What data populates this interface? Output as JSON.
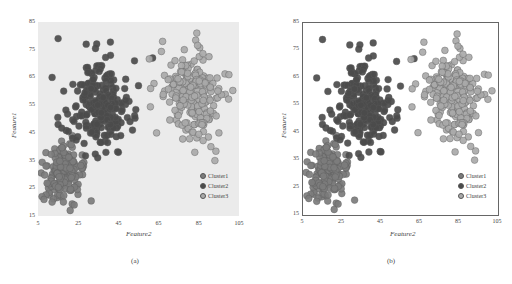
{
  "figure": {
    "panels": [
      {
        "id": "a",
        "caption": "(a)",
        "style": "ggplot-gray-background"
      },
      {
        "id": "b",
        "caption": "(b)",
        "style": "framed-white-background"
      }
    ]
  },
  "chart_data": [
    {
      "type": "scatter",
      "title": "",
      "caption": "(a)",
      "xlabel": "Feature2",
      "ylabel": "Feature1",
      "xlim": [
        5,
        105
      ],
      "ylim": [
        15,
        85
      ],
      "xticks": [
        "5",
        "25",
        "45",
        "65",
        "85",
        "105"
      ],
      "yticks": [
        "15",
        "25",
        "35",
        "45",
        "55",
        "65",
        "75",
        "85"
      ],
      "grid": false,
      "background": "#ebebeb",
      "legend_position": "lower right",
      "series": [
        {
          "name": "Cluster1",
          "color": "#7c7c7c",
          "center": [
            17,
            30
          ],
          "spread": [
            5,
            5
          ],
          "count": 170
        },
        {
          "name": "Cluster2",
          "color": "#4b4b4b",
          "center": [
            35,
            55
          ],
          "spread": [
            7,
            7.5
          ],
          "count": 230
        },
        {
          "name": "Cluster3",
          "color": "#a9a9a9",
          "center": [
            82,
            58
          ],
          "spread": [
            7,
            8
          ],
          "count": 220
        }
      ]
    },
    {
      "type": "scatter",
      "title": "",
      "caption": "(b)",
      "xlabel": "Feature2",
      "ylabel": "Feature1",
      "xlim": [
        5,
        105
      ],
      "ylim": [
        15,
        85
      ],
      "xticks": [
        "5",
        "25",
        "45",
        "65",
        "85",
        "105"
      ],
      "yticks": [
        "15",
        "25",
        "35",
        "45",
        "55",
        "65",
        "75",
        "85"
      ],
      "grid": false,
      "background": "#ffffff",
      "legend_position": "lower right",
      "series": [
        {
          "name": "Cluster1",
          "color": "#7c7c7c",
          "center": [
            17,
            30
          ],
          "spread": [
            5,
            5
          ],
          "count": 170
        },
        {
          "name": "Cluster2",
          "color": "#4b4b4b",
          "center": [
            35,
            55
          ],
          "spread": [
            7,
            7.5
          ],
          "count": 230
        },
        {
          "name": "Cluster3",
          "color": "#a9a9a9",
          "center": [
            82,
            58
          ],
          "spread": [
            7,
            8
          ],
          "count": 220
        }
      ]
    }
  ],
  "outliers": {
    "Cluster1": [
      [
        7,
        22
      ],
      [
        8,
        21
      ],
      [
        9,
        33
      ],
      [
        12,
        20
      ],
      [
        21,
        17
      ],
      [
        23,
        19
      ],
      [
        22,
        44
      ],
      [
        27,
        37
      ]
    ],
    "Cluster2": [
      [
        15,
        79
      ],
      [
        29,
        77
      ],
      [
        12,
        65
      ],
      [
        53,
        71
      ],
      [
        62,
        72
      ],
      [
        55,
        62
      ],
      [
        52,
        46
      ],
      [
        15,
        48
      ],
      [
        45,
        38
      ]
    ],
    "Cluster3": [
      [
        67,
        78
      ],
      [
        84,
        81
      ],
      [
        100,
        66
      ],
      [
        93,
        35
      ],
      [
        91,
        40
      ],
      [
        83,
        38
      ],
      [
        64,
        45
      ],
      [
        61,
        61
      ],
      [
        95,
        45
      ]
    ]
  }
}
